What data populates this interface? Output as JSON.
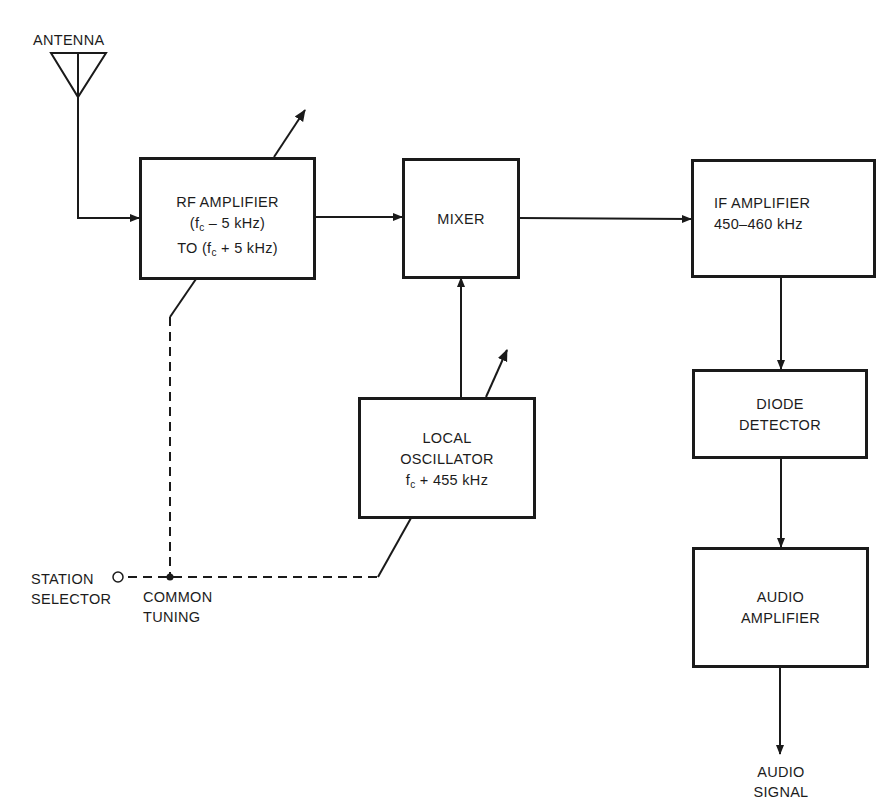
{
  "diagram": {
    "type": "block-diagram",
    "antenna": {
      "label": "ANTENNA"
    },
    "blocks": {
      "rf_amplifier": {
        "line1": "RF AMPLIFIER",
        "line2_pre": "(f",
        "line2_sub": "c",
        "line2_post": " – 5 kHz)",
        "line3_pre": "TO (f",
        "line3_sub": "c",
        "line3_post": " + 5 kHz)"
      },
      "mixer": {
        "line1": "MIXER"
      },
      "if_amplifier": {
        "line1": "IF AMPLIFIER",
        "line2": "450–460  kHz"
      },
      "local_oscillator": {
        "line1": "LOCAL",
        "line2": "OSCILLATOR",
        "line3_pre": "f",
        "line3_sub": "c",
        "line3_post": " + 455 kHz"
      },
      "diode_detector": {
        "line1": "DIODE",
        "line2": "DETECTOR"
      },
      "audio_amplifier": {
        "line1": "AUDIO",
        "line2": "AMPLIFIER"
      }
    },
    "labels": {
      "station_selector_1": "STATION",
      "station_selector_2": "SELECTOR",
      "common_tuning_1": "COMMON",
      "common_tuning_2": "TUNING",
      "audio_signal_1": "AUDIO",
      "audio_signal_2": "SIGNAL"
    },
    "connections": [
      {
        "from": "antenna",
        "to": "rf_amplifier",
        "style": "solid-arrow"
      },
      {
        "from": "rf_amplifier",
        "to": "mixer",
        "style": "solid-arrow"
      },
      {
        "from": "local_oscillator",
        "to": "mixer",
        "style": "solid-arrow"
      },
      {
        "from": "mixer",
        "to": "if_amplifier",
        "style": "solid-arrow"
      },
      {
        "from": "if_amplifier",
        "to": "diode_detector",
        "style": "solid-arrow"
      },
      {
        "from": "diode_detector",
        "to": "audio_amplifier",
        "style": "solid-arrow"
      },
      {
        "from": "audio_amplifier",
        "to": "audio_signal",
        "style": "solid-arrow"
      },
      {
        "from": "station_selector",
        "to": "rf_amplifier",
        "style": "dashed (common tuning)"
      },
      {
        "from": "station_selector",
        "to": "local_oscillator",
        "style": "dashed (common tuning)"
      }
    ],
    "colors": {
      "ink": "#1a1a1a",
      "background": "#ffffff"
    }
  }
}
